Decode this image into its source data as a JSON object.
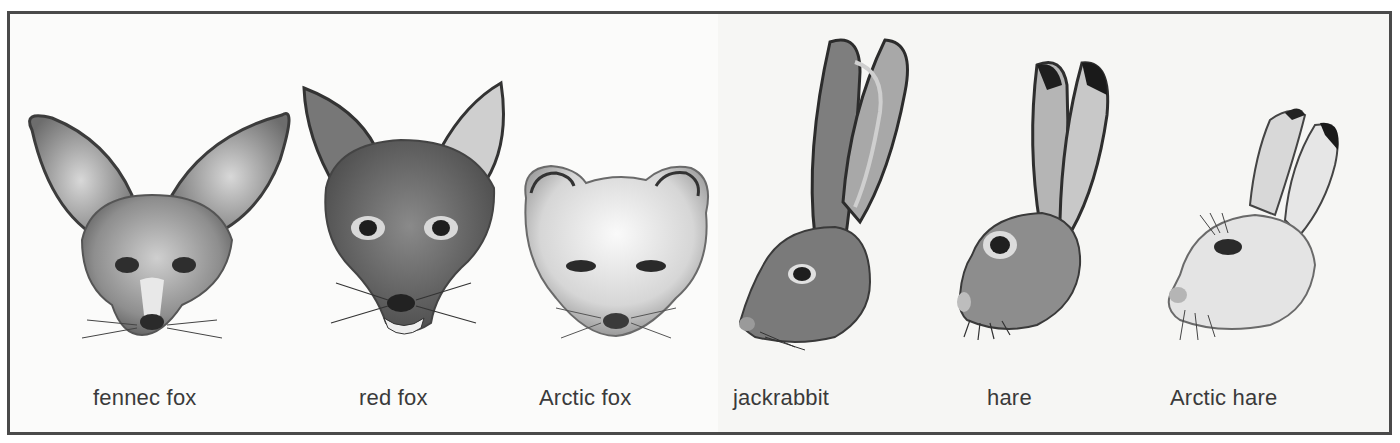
{
  "figure": {
    "panels": [
      {
        "id": "fennec-fox",
        "label": "fennec fox",
        "kind": "fox"
      },
      {
        "id": "red-fox",
        "label": "red fox",
        "kind": "fox"
      },
      {
        "id": "arctic-fox",
        "label": "Arctic fox",
        "kind": "fox"
      },
      {
        "id": "jackrabbit",
        "label": "jackrabbit",
        "kind": "hare"
      },
      {
        "id": "hare",
        "label": "hare",
        "kind": "hare"
      },
      {
        "id": "arctic-hare",
        "label": "Arctic hare",
        "kind": "hare"
      }
    ],
    "colors": {
      "border": "#4a4a4a",
      "label_text": "#3a3a3a",
      "background": "#fbfbfa"
    }
  }
}
